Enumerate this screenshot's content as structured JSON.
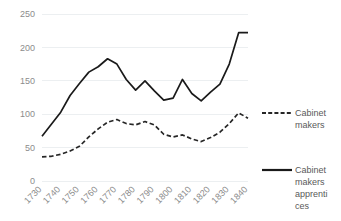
{
  "chart_data": {
    "type": "line",
    "title": "",
    "subtitle": "",
    "xlabel": "",
    "ylabel": "",
    "x": [
      1730,
      1740,
      1750,
      1760,
      1770,
      1780,
      1790,
      1800,
      1810,
      1820,
      1830,
      1840
    ],
    "categories": [
      "1730",
      "1740",
      "1750",
      "1760",
      "1770",
      "1780",
      "1790",
      "1800",
      "1810",
      "1820",
      "1830",
      "1840"
    ],
    "x_tick_labels": [
      "1730",
      "1740",
      "1750",
      "1760",
      "1770",
      "1780",
      "1790",
      "1800",
      "1810",
      "1820",
      "1830",
      "1840"
    ],
    "y_tick_labels": [
      "0",
      "50",
      "100",
      "150",
      "200",
      "250"
    ],
    "y_ticks": [
      0,
      50,
      100,
      150,
      200,
      250
    ],
    "ylim": [
      0,
      250
    ],
    "xlim": [
      1730,
      1840
    ],
    "grid": "horizontal",
    "legend_position": "right",
    "series": [
      {
        "name": "Cabinet makers",
        "style": "dashed",
        "color": "#262626",
        "x": [
          1730,
          1735,
          1740,
          1745,
          1750,
          1755,
          1760,
          1765,
          1770,
          1775,
          1780,
          1785,
          1790,
          1795,
          1800,
          1805,
          1810,
          1815,
          1820,
          1825,
          1830,
          1835,
          1840
        ],
        "values": [
          36,
          37,
          40,
          45,
          52,
          66,
          78,
          88,
          92,
          86,
          84,
          89,
          84,
          70,
          66,
          69,
          63,
          59,
          65,
          73,
          86,
          102,
          94
        ]
      },
      {
        "name": "Cabinet makers apprentices",
        "style": "solid",
        "color": "#1a1a1a",
        "x": [
          1730,
          1735,
          1740,
          1745,
          1750,
          1755,
          1760,
          1765,
          1770,
          1775,
          1780,
          1785,
          1790,
          1795,
          1800,
          1805,
          1810,
          1815,
          1820,
          1825,
          1830,
          1835,
          1840
        ],
        "values": [
          67,
          85,
          103,
          128,
          146,
          163,
          171,
          183,
          175,
          152,
          136,
          150,
          135,
          121,
          124,
          152,
          131,
          120,
          133,
          145,
          175,
          222,
          222
        ]
      }
    ],
    "legend": [
      {
        "label": "Cabinet makers",
        "label_lines": [
          "Cabinet",
          "makers"
        ],
        "style": "dashed",
        "color": "#262626"
      },
      {
        "label": "Cabinet makers apprentices",
        "label_lines": [
          "Cabinet",
          "makers",
          "apprenti",
          "ces"
        ],
        "style": "solid",
        "color": "#1a1a1a"
      }
    ],
    "colors": {
      "gridline": "#eceff1",
      "tick_text": "#8c8c8c",
      "legend_text": "#595959",
      "background": "#ffffff"
    }
  }
}
